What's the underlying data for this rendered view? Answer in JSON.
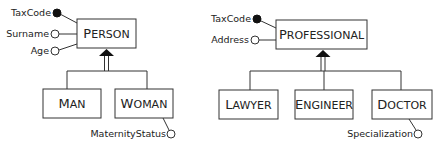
{
  "diagram": {
    "type": "ER generalization hierarchies",
    "hierarchies": [
      {
        "parent": {
          "name": "Person",
          "first": "P",
          "rest": "ERSON"
        },
        "parent_attributes": [
          {
            "name": "TaxCode",
            "identifier": true
          },
          {
            "name": "Surname",
            "identifier": false
          },
          {
            "name": "Age",
            "identifier": false
          }
        ],
        "children": [
          {
            "name": "Man",
            "first": "M",
            "rest": "AN",
            "attributes": []
          },
          {
            "name": "Woman",
            "first": "W",
            "rest": "OMAN",
            "attributes": [
              {
                "name": "MaternityStatus",
                "identifier": false
              }
            ]
          }
        ]
      },
      {
        "parent": {
          "name": "Professional",
          "first": "P",
          "rest": "ROFESSIONAL"
        },
        "parent_attributes": [
          {
            "name": "TaxCode",
            "identifier": true
          },
          {
            "name": "Address",
            "identifier": false
          }
        ],
        "children": [
          {
            "name": "Lawyer",
            "first": "L",
            "rest": "AWYER",
            "attributes": []
          },
          {
            "name": "Engineer",
            "first": "E",
            "rest": "NGINEER",
            "attributes": []
          },
          {
            "name": "Doctor",
            "first": "D",
            "rest": "OCTOR",
            "attributes": [
              {
                "name": "Specialization",
                "identifier": false
              }
            ]
          }
        ]
      }
    ]
  }
}
